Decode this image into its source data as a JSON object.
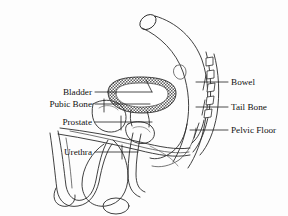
{
  "diagram": {
    "background_color": "#fdfdfd",
    "line_color": "#2b2b2b",
    "text_color": "#111111",
    "width": 288,
    "height": 216
  },
  "labels": {
    "left": [
      {
        "id": "bladder",
        "text": "Bladder",
        "x": 92,
        "y": 95,
        "leader_to_x": 150,
        "leader_to_y": 95
      },
      {
        "id": "pubic_bone",
        "text": "Pubic Bone",
        "x": 92,
        "y": 107,
        "leader_to_x": 150,
        "leader_to_y": 107
      },
      {
        "id": "prostate",
        "text": "Prostate",
        "x": 92,
        "y": 125,
        "leader_to_x": 150,
        "leader_to_y": 125
      },
      {
        "id": "urethra",
        "text": "Urethra",
        "x": 92,
        "y": 155,
        "leader_to_x": 132,
        "leader_to_y": 155
      }
    ],
    "right": [
      {
        "id": "bowel",
        "text": "Bowel",
        "x": 230,
        "y": 85,
        "leader_to_x": 205,
        "leader_to_y": 85
      },
      {
        "id": "tail_bone",
        "text": "Tail Bone",
        "x": 230,
        "y": 110,
        "leader_to_x": 198,
        "leader_to_y": 110
      },
      {
        "id": "pelvic_floor",
        "text": "Pelvic Floor",
        "x": 230,
        "y": 133,
        "leader_to_x": 196,
        "leader_to_y": 133
      }
    ]
  },
  "structures": [
    {
      "id": "bowel",
      "name": "bowel-tube",
      "style": "outline"
    },
    {
      "id": "bladder",
      "name": "bladder",
      "style": "hatched-ring"
    },
    {
      "id": "tail_bone",
      "name": "tail-bone-vertebrae",
      "style": "segmented",
      "segment_count": 5
    },
    {
      "id": "pubic_bone",
      "name": "pubic-bone",
      "style": "outline"
    },
    {
      "id": "prostate",
      "name": "prostate",
      "style": "outline"
    },
    {
      "id": "pelvic_floor",
      "name": "pelvic-floor",
      "style": "outline"
    },
    {
      "id": "urethra",
      "name": "urethra",
      "style": "tube"
    },
    {
      "id": "penis",
      "name": "penis-body",
      "style": "outline"
    },
    {
      "id": "scrotum",
      "name": "scrotum",
      "style": "outline"
    }
  ]
}
